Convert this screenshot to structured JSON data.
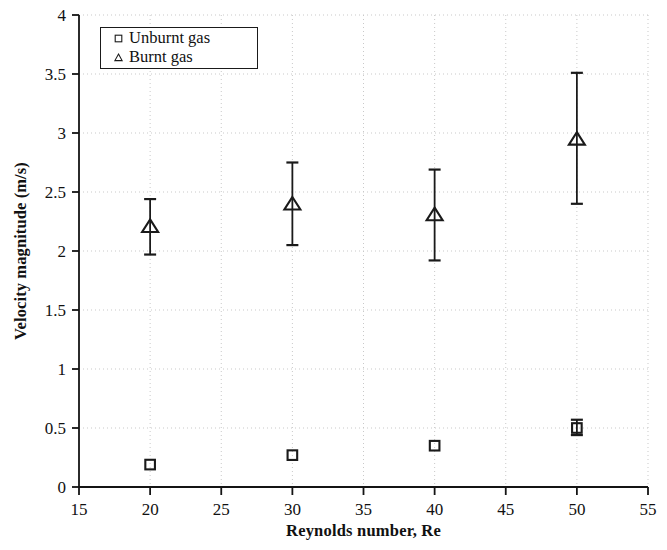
{
  "chart_data": {
    "type": "scatter",
    "title": "",
    "xlabel": "Reynolds number, Re",
    "ylabel": "Velocity magnitude (m/s)",
    "xlim": [
      15,
      55
    ],
    "ylim": [
      0,
      4
    ],
    "xticks": [
      "15",
      "20",
      "25",
      "30",
      "35",
      "40",
      "45",
      "50",
      "55"
    ],
    "yticks": [
      "0",
      "0.5",
      "1",
      "1.5",
      "2",
      "2.5",
      "3",
      "3.5",
      "4"
    ],
    "grid": true,
    "grid_style": "dotted",
    "legend_position": "upper left",
    "x": [
      20,
      30,
      40,
      50
    ],
    "series": [
      {
        "name": "Unburnt gas",
        "marker": "square",
        "marker_fill": "open",
        "color": "#1a1a1a",
        "values": [
          0.19,
          0.27,
          0.35,
          0.5
        ],
        "err_low": [
          0.0,
          0.0,
          0.0,
          0.06
        ],
        "err_high": [
          0.0,
          0.0,
          0.0,
          0.07
        ]
      },
      {
        "name": "Burnt gas",
        "marker": "triangle",
        "marker_fill": "open",
        "color": "#1a1a1a",
        "values": [
          2.21,
          2.4,
          2.31,
          2.95
        ],
        "err_low": [
          0.24,
          0.35,
          0.39,
          0.55
        ],
        "err_high": [
          0.23,
          0.35,
          0.38,
          0.56
        ]
      }
    ]
  },
  "legend": {
    "entries": [
      {
        "label": "Unburnt gas",
        "marker": "square"
      },
      {
        "label": "Burnt gas",
        "marker": "triangle"
      }
    ]
  },
  "axes": {
    "x_title": "Reynolds number, Re",
    "y_title": "Velocity magnitude (m/s)"
  }
}
